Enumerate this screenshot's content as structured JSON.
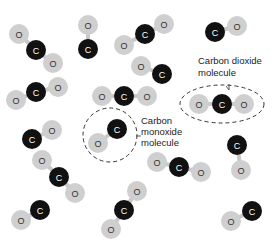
{
  "diagram": {
    "width": 278,
    "height": 247,
    "colors": {
      "background": "#ffffff",
      "carbon_fill": "#111111",
      "carbon_text": "#ffffff",
      "oxygen_fill": "#cfcfcf",
      "oxygen_text": "#333333",
      "bond": "#c8c8c8",
      "callout_stroke": "#333333",
      "callout_text": "#222222"
    },
    "atom_radius": {
      "C": 10,
      "O": 10
    },
    "atom_labels": {
      "C": "C",
      "O": "O"
    },
    "molecules": [
      {
        "type": "CO2",
        "atoms": [
          [
            "O",
            19,
            34
          ],
          [
            "C",
            36,
            50
          ],
          [
            "O",
            53,
            63
          ]
        ]
      },
      {
        "type": "CO",
        "atoms": [
          [
            "O",
            88,
            25
          ],
          [
            "C",
            88,
            49
          ]
        ]
      },
      {
        "type": "CO2",
        "atoms": [
          [
            "O",
            124,
            45
          ],
          [
            "C",
            145,
            34
          ],
          [
            "O",
            164,
            24
          ]
        ]
      },
      {
        "type": "CO",
        "atoms": [
          [
            "C",
            215,
            32
          ],
          [
            "O",
            237,
            26
          ]
        ]
      },
      {
        "type": "CO2",
        "atoms": [
          [
            "O",
            16,
            100
          ],
          [
            "C",
            36,
            92
          ],
          [
            "O",
            58,
            87
          ]
        ]
      },
      {
        "type": "CO",
        "atoms": [
          [
            "O",
            141,
            66
          ],
          [
            "C",
            162,
            74
          ]
        ]
      },
      {
        "type": "CO2",
        "atoms": [
          [
            "O",
            102,
            96
          ],
          [
            "C",
            124,
            96
          ],
          [
            "O",
            147,
            96
          ]
        ]
      },
      {
        "type": "CO2",
        "highlight": "co2",
        "atoms": [
          [
            "O",
            199,
            104
          ],
          [
            "C",
            222,
            104
          ],
          [
            "O",
            244,
            104
          ]
        ]
      },
      {
        "type": "CO",
        "atoms": [
          [
            "C",
            32,
            139
          ],
          [
            "O",
            52,
            130
          ]
        ]
      },
      {
        "type": "CO",
        "highlight": "co",
        "atoms": [
          [
            "C",
            117,
            129
          ],
          [
            "O",
            98,
            143
          ]
        ]
      },
      {
        "type": "CO2",
        "atoms": [
          [
            "O",
            42,
            160
          ],
          [
            "C",
            59,
            177
          ],
          [
            "O",
            75,
            193
          ]
        ]
      },
      {
        "type": "CO2",
        "atoms": [
          [
            "O",
            157,
            162
          ],
          [
            "C",
            179,
            167
          ],
          [
            "O",
            201,
            172
          ]
        ]
      },
      {
        "type": "CO",
        "atoms": [
          [
            "C",
            237,
            145
          ],
          [
            "O",
            241,
            170
          ]
        ]
      },
      {
        "type": "CO",
        "atoms": [
          [
            "O",
            21,
            220
          ],
          [
            "C",
            40,
            210
          ]
        ]
      },
      {
        "type": "CO2",
        "atoms": [
          [
            "O",
            137,
            191
          ],
          [
            "C",
            124,
            210
          ],
          [
            "O",
            111,
            229
          ]
        ]
      },
      {
        "type": "CO",
        "atoms": [
          [
            "C",
            252,
            211
          ],
          [
            "O",
            231,
            221
          ]
        ]
      }
    ],
    "callouts": {
      "co2": {
        "label_lines": [
          "Carbon dioxide",
          "molecule"
        ],
        "label_x": 198,
        "label_y": 64,
        "ellipse": {
          "cx": 222,
          "cy": 104,
          "rx": 42,
          "ry": 19
        },
        "leader": [
          [
            229,
            84
          ],
          [
            229,
            90
          ],
          [
            226,
            86
          ]
        ]
      },
      "co": {
        "label_lines": [
          "Carbon",
          "monoxide",
          "molecule"
        ],
        "label_x": 141,
        "label_y": 124,
        "circle": {
          "cx": 110,
          "cy": 135,
          "r": 27
        },
        "leader": [
          [
            136,
            136
          ],
          [
            141,
            136
          ]
        ]
      }
    }
  }
}
